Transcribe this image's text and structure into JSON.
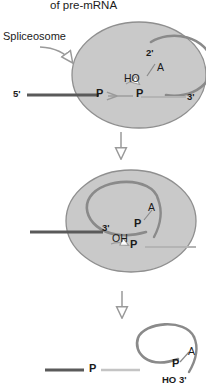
{
  "figure": {
    "title": "of pre-mRNA",
    "colors": {
      "spliceosome_fill": "#c9c9c9",
      "spliceosome_stroke": "#8f8f8f",
      "intron_arc": "#8a8a8a",
      "exon_5prime": "#5a5a5a",
      "exon_3prime": "#b4b4b4",
      "arrow": "#9a9a9a",
      "text": "#1b1b1b"
    }
  },
  "panels": {
    "step1": {
      "name": "first-transesterification",
      "spliceosome_label": "Spliceosome",
      "labels": {
        "five_prime": "5'",
        "three_prime": "3'",
        "branch_prime": "2'",
        "branch_base": "A",
        "hydroxyl": "HO",
        "p_left": "P",
        "p_right": "P"
      }
    },
    "step2": {
      "name": "lariat-intermediate",
      "labels": {
        "three_prime": "3'",
        "hydroxyl": "OH",
        "branch_base": "A",
        "p_branch": "P",
        "p_right": "P"
      }
    },
    "step3": {
      "name": "spliced-products",
      "labels": {
        "p_join": "P",
        "branch_base": "A",
        "p_branch": "P",
        "ho_three_prime": "HO 3'"
      }
    }
  },
  "arrows": {
    "step1_to_step2": "down-arrow",
    "step2_to_step3": "down-arrow",
    "spliceosome_pointer": "curved-arrow"
  }
}
